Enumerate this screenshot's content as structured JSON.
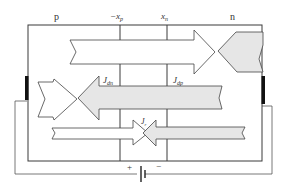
{
  "diagram": {
    "regions": {
      "p_label": "p",
      "n_label": "n",
      "left_boundary": "−x",
      "left_boundary_sub": "p",
      "right_boundary": "x",
      "right_boundary_sub": "n"
    },
    "currents": {
      "electron_diffusion": {
        "symbol": "J",
        "sub": "dn"
      },
      "hole_diffusion": {
        "symbol": "J",
        "sub": "dp"
      },
      "recombination": {
        "symbol": "J",
        "sub": "r"
      }
    },
    "battery": {
      "plus": "+",
      "minus": "−"
    },
    "colors": {
      "line": "#3a3a3a",
      "shaded_arrow": "#e6e6e6",
      "white_arrow": "#ffffff",
      "contact": "#111111",
      "wire": "#555555"
    }
  }
}
